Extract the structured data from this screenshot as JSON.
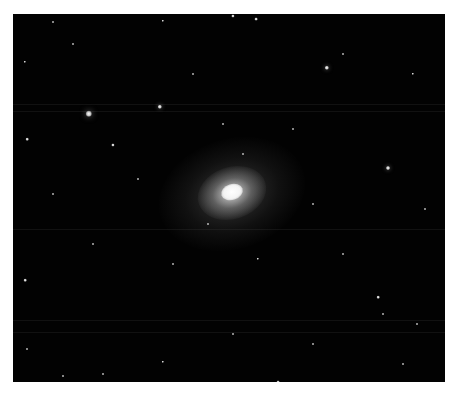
{
  "image": {
    "subject": "elliptical galaxy in star field",
    "background_color": "#ffffff",
    "frame_color": "#020202"
  },
  "galaxy": {
    "x": 219,
    "y": 178,
    "core_color": "#ffffff"
  },
  "stars": [
    {
      "x": 76,
      "y": 100,
      "r": 3.2
    },
    {
      "x": 147,
      "y": 93,
      "r": 2.2
    },
    {
      "x": 314,
      "y": 54,
      "r": 2.2
    },
    {
      "x": 375,
      "y": 154,
      "r": 2.0
    },
    {
      "x": 100,
      "y": 131,
      "r": 1.6
    },
    {
      "x": 220,
      "y": 2,
      "r": 1.6
    },
    {
      "x": 243,
      "y": 5,
      "r": 1.4
    },
    {
      "x": 150,
      "y": 7,
      "r": 1.2
    },
    {
      "x": 40,
      "y": 8,
      "r": 1.0
    },
    {
      "x": 12,
      "y": 48,
      "r": 1.2
    },
    {
      "x": 14,
      "y": 125,
      "r": 1.3
    },
    {
      "x": 12,
      "y": 266,
      "r": 1.3
    },
    {
      "x": 14,
      "y": 335,
      "r": 1.0
    },
    {
      "x": 400,
      "y": 60,
      "r": 1.2
    },
    {
      "x": 412,
      "y": 195,
      "r": 1.0
    },
    {
      "x": 365,
      "y": 283,
      "r": 1.3
    },
    {
      "x": 370,
      "y": 300,
      "r": 1.0
    },
    {
      "x": 404,
      "y": 310,
      "r": 1.0
    },
    {
      "x": 245,
      "y": 245,
      "r": 1.2
    },
    {
      "x": 125,
      "y": 165,
      "r": 1.0
    },
    {
      "x": 280,
      "y": 115,
      "r": 1.0
    },
    {
      "x": 195,
      "y": 210,
      "r": 1.0
    },
    {
      "x": 300,
      "y": 190,
      "r": 1.0
    },
    {
      "x": 137,
      "y": 370,
      "r": 1.2
    },
    {
      "x": 265,
      "y": 368,
      "r": 1.4
    },
    {
      "x": 150,
      "y": 348,
      "r": 1.2
    },
    {
      "x": 50,
      "y": 362,
      "r": 1.0
    },
    {
      "x": 90,
      "y": 360,
      "r": 1.0
    },
    {
      "x": 60,
      "y": 30,
      "r": 1.0
    },
    {
      "x": 330,
      "y": 40,
      "r": 1.0
    },
    {
      "x": 180,
      "y": 60,
      "r": 1.0
    },
    {
      "x": 230,
      "y": 140,
      "r": 1.0
    },
    {
      "x": 210,
      "y": 110,
      "r": 1.0
    },
    {
      "x": 160,
      "y": 250,
      "r": 1.0
    },
    {
      "x": 330,
      "y": 240,
      "r": 1.0
    },
    {
      "x": 80,
      "y": 230,
      "r": 1.0
    },
    {
      "x": 40,
      "y": 180,
      "r": 1.0
    },
    {
      "x": 300,
      "y": 330,
      "r": 1.0
    },
    {
      "x": 220,
      "y": 320,
      "r": 1.0
    },
    {
      "x": 390,
      "y": 350,
      "r": 1.0
    }
  ],
  "streaks_y": [
    90,
    97,
    215,
    306,
    318
  ]
}
